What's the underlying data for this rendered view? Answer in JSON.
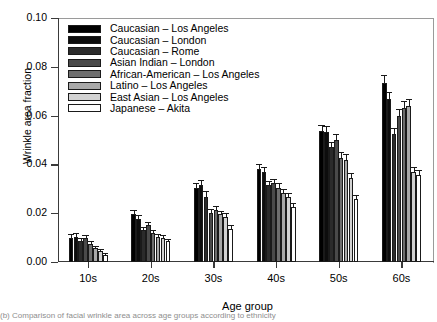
{
  "chart_data": {
    "type": "bar",
    "title": "",
    "xlabel": "Age group",
    "ylabel": "Wrinkle area fraction",
    "categories": [
      "10s",
      "20s",
      "30s",
      "40s",
      "50s",
      "60s"
    ],
    "ylim": [
      0.0,
      0.1
    ],
    "yticks": [
      "0.00",
      "0.02",
      "0.04",
      "0.06",
      "0.08",
      "0.10"
    ],
    "ytick_values": [
      0.0,
      0.02,
      0.04,
      0.06,
      0.08,
      0.1
    ],
    "grid": false,
    "legend_position": "upper-left-inside",
    "error_bars": true,
    "series": [
      {
        "name": "Caucasian – Los Angeles",
        "color": "#000000",
        "values": [
          0.01,
          0.0196,
          0.0303,
          0.038,
          0.0537,
          0.0733
        ],
        "errors": [
          0.0014,
          0.0016,
          0.0021,
          0.0022,
          0.0026,
          0.0035
        ]
      },
      {
        "name": "Caucasian – London",
        "color": "#0d0d0d",
        "values": [
          0.0104,
          0.0178,
          0.0317,
          0.0367,
          0.0533,
          0.0667
        ],
        "errors": [
          0.0013,
          0.0014,
          0.002,
          0.0021,
          0.0025,
          0.003
        ]
      },
      {
        "name": "Caucasian – Rome",
        "color": "#2b2b2b",
        "values": [
          0.0085,
          0.0131,
          0.0267,
          0.0315,
          0.047,
          0.0523
        ],
        "errors": [
          0.0012,
          0.0013,
          0.0022,
          0.0017,
          0.0022,
          0.0026
        ]
      },
      {
        "name": "Asian  Indian – London",
        "color": "#4a4a4a",
        "values": [
          0.0097,
          0.015,
          0.0202,
          0.0322,
          0.05,
          0.06
        ],
        "errors": [
          0.0013,
          0.0015,
          0.0016,
          0.0018,
          0.0024,
          0.0028
        ]
      },
      {
        "name": "African-American – Los Angeles",
        "color": "#6e6e6e",
        "values": [
          0.0074,
          0.0119,
          0.0213,
          0.0305,
          0.0428,
          0.0633
        ],
        "errors": [
          0.0011,
          0.0012,
          0.0017,
          0.0017,
          0.0021,
          0.0027
        ]
      },
      {
        "name": "Latino – Los Angeles",
        "color": "#a8a8a8",
        "values": [
          0.0056,
          0.0104,
          0.0196,
          0.0283,
          0.0418,
          0.0639
        ],
        "errors": [
          0.001,
          0.0011,
          0.0015,
          0.0017,
          0.0024,
          0.0029
        ]
      },
      {
        "name": "East Asian – Los Angeles",
        "color": "#d2d2d2",
        "values": [
          0.0044,
          0.0098,
          0.0185,
          0.0265,
          0.0343,
          0.0367
        ],
        "errors": [
          0.0009,
          0.0011,
          0.0015,
          0.0016,
          0.002,
          0.0022
        ]
      },
      {
        "name": "Japanese – Akita",
        "color": "#ffffff",
        "values": [
          0.003,
          0.0085,
          0.0137,
          0.0226,
          0.0259,
          0.0357
        ],
        "errors": [
          0.0008,
          0.001,
          0.0013,
          0.0015,
          0.0017,
          0.002
        ]
      }
    ]
  },
  "axes": {
    "ylabel": "Wrinkle area fraction",
    "xlabel": "Age group"
  },
  "caption": {
    "text": "(b) Comparison of facial wrinkle area across age groups according to ethnicity"
  }
}
